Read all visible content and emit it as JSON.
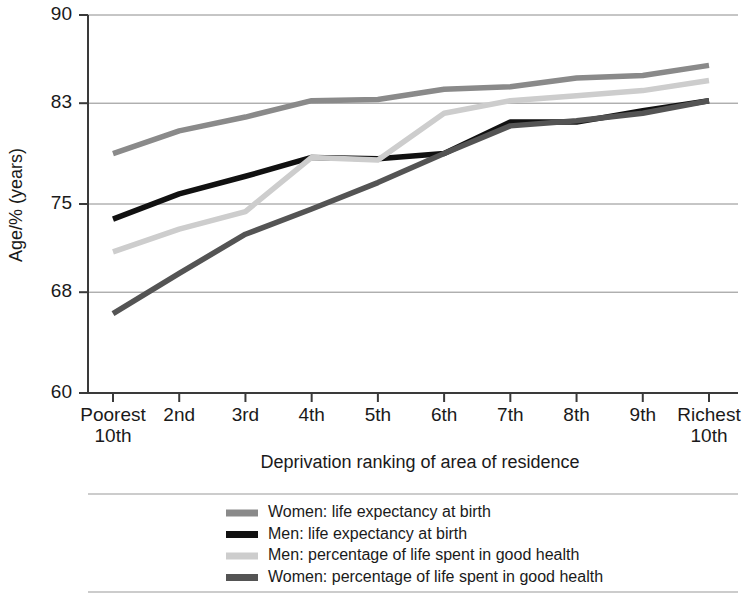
{
  "chart_data": {
    "type": "line",
    "title": "",
    "subtitle": "",
    "xlabel": "Deprivation ranking of area of residence",
    "ylabel": "Age/% (years)",
    "categories": [
      "Poorest\n10th",
      "2nd",
      "3rd",
      "4th",
      "5th",
      "6th",
      "7th",
      "8th",
      "9th",
      "Richest\n10th"
    ],
    "category_lines": [
      [
        "Poorest",
        "10th"
      ],
      [
        "2nd",
        ""
      ],
      [
        "3rd",
        ""
      ],
      [
        "4th",
        ""
      ],
      [
        "5th",
        ""
      ],
      [
        "6th",
        ""
      ],
      [
        "7th",
        ""
      ],
      [
        "8th",
        ""
      ],
      [
        "9th",
        ""
      ],
      [
        "Richest",
        "10th"
      ]
    ],
    "ylim": [
      60,
      90
    ],
    "yticks": [
      60,
      68,
      75,
      83,
      90
    ],
    "ytick_labels": [
      "60",
      "68",
      "75",
      "83",
      "90"
    ],
    "grid": "horizontal",
    "legend_position": "bottom",
    "series": [
      {
        "name": "Women: life expectancy at birth",
        "color": "#8a8a8a",
        "values": [
          79.0,
          80.8,
          81.9,
          83.2,
          83.3,
          84.1,
          84.3,
          85.0,
          85.2,
          86.0
        ]
      },
      {
        "name": "Men: life expectancy at birth",
        "color": "#111111",
        "values": [
          73.8,
          75.8,
          77.2,
          78.7,
          78.6,
          79.0,
          81.5,
          81.5,
          82.4,
          83.2
        ]
      },
      {
        "name": "Men: percentage of life spent in good health",
        "color": "#cdcdcd",
        "values": [
          71.2,
          73.0,
          74.4,
          78.7,
          78.5,
          82.2,
          83.2,
          83.6,
          84.0,
          84.8
        ]
      },
      {
        "name": "Women: percentage of life spent in good health",
        "color": "#545454",
        "values": [
          66.3,
          69.5,
          72.6,
          74.6,
          76.7,
          79.0,
          81.2,
          81.6,
          82.2,
          83.2
        ]
      }
    ]
  },
  "legend": {
    "entries": [
      "Women: life expectancy at birth",
      "Men: life expectancy at birth",
      "Men: percentage of life spent in good health",
      "Women: percentage of life spent in good health"
    ]
  }
}
